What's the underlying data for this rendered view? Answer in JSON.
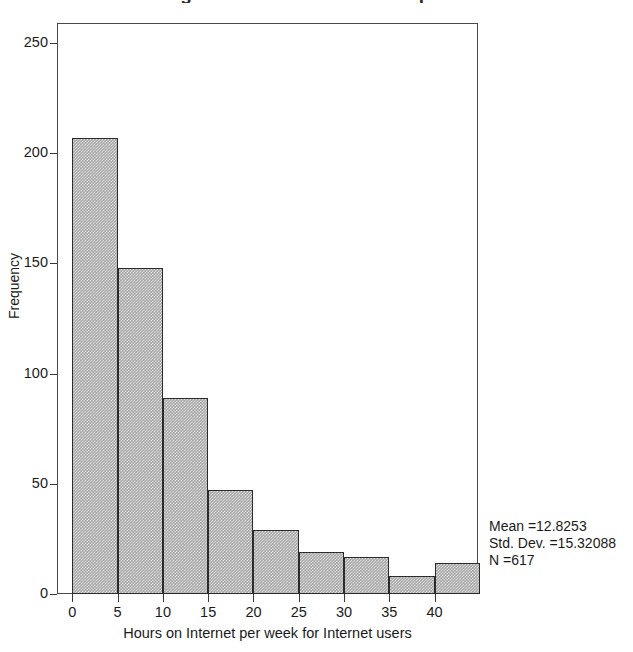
{
  "chart_data": {
    "type": "bar",
    "title": "Histogram of Hours on Internet per week",
    "xlabel": "Hours on Internet per week for Internet users",
    "ylabel": "Frequency",
    "bin_width": 5,
    "bin_starts": [
      0,
      5,
      10,
      15,
      20,
      25,
      30,
      35,
      40
    ],
    "categories": [
      "0-5",
      "5-10",
      "10-15",
      "15-20",
      "20-25",
      "25-30",
      "30-35",
      "35-40",
      "40-45"
    ],
    "values": [
      207,
      148,
      89,
      47,
      29,
      19,
      17,
      8,
      14
    ],
    "xlim": [
      -1.7,
      44.8
    ],
    "ylim": [
      0,
      259
    ],
    "xticks": [
      0,
      5,
      10,
      15,
      20,
      25,
      30,
      35,
      40
    ],
    "yticks": [
      0,
      50,
      100,
      150,
      200,
      250
    ],
    "grid": false,
    "legend": null,
    "bar_fill": "#a8a8a8",
    "bar_edge": "#2b2b2b",
    "annotations": {
      "mean_label": "Mean =12.8253",
      "std_label": "Std. Dev. =15.32088",
      "n_label": "N =617",
      "mean": 12.8253,
      "std_dev": 15.32088,
      "n": 617
    }
  },
  "axes": {
    "y_tick_labels": [
      "250",
      "200",
      "150",
      "100",
      "50",
      "0"
    ],
    "x_tick_labels": [
      "0",
      "5",
      "10",
      "15",
      "20",
      "25",
      "30",
      "35",
      "40"
    ],
    "y_title": "Frequency",
    "x_title": "Hours on Internet per week for Internet users"
  },
  "stats": {
    "line1": "Mean =12.8253",
    "line2": "Std. Dev. =15.32088",
    "line3": "N =617"
  }
}
